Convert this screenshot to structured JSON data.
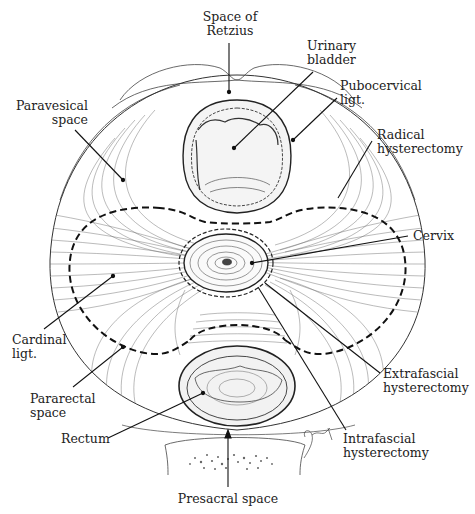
{
  "figure": {
    "colors": {
      "ink": "#222222",
      "fiber": "#555555",
      "background": "#ffffff"
    }
  },
  "labels": [
    {
      "id": "space-of-retzius",
      "text": "Space of\nRetzius",
      "x": 204,
      "y": 12,
      "align": "center",
      "w": 60,
      "leader": [
        [
          229,
          43
        ],
        [
          229,
          92
        ]
      ],
      "dot": [
        229,
        92
      ]
    },
    {
      "id": "urinary-bladder",
      "text": "Urinary\nbladder",
      "x": 308,
      "y": 40,
      "align": "left",
      "w": 60,
      "leader": [
        [
          313,
          72
        ],
        [
          234,
          148
        ]
      ],
      "dot": [
        234,
        148
      ]
    },
    {
      "id": "pubocervical-ligt",
      "text": "Pubocervical\nligt.",
      "x": 341,
      "y": 80,
      "align": "left",
      "w": 90,
      "leader": [
        [
          337,
          98
        ],
        [
          293,
          140
        ]
      ],
      "dot": [
        293,
        140
      ]
    },
    {
      "id": "paravesical-space",
      "text": "Paravesical\nspace",
      "x": 20,
      "y": 100,
      "align": "right",
      "w": 88,
      "leader": [
        [
          75,
          130
        ],
        [
          123,
          180
        ]
      ],
      "dot": [
        123,
        180
      ]
    },
    {
      "id": "radical-hysterectomy",
      "text": "Radical\nhysterectomy",
      "x": 377,
      "y": 128,
      "align": "left",
      "w": 95,
      "leader": [
        [
          372,
          141
        ],
        [
          338,
          198
        ]
      ],
      "dot": null
    },
    {
      "id": "cervix",
      "text": "Cervix",
      "x": 415,
      "y": 230,
      "align": "left",
      "w": 50,
      "leader": [
        [
          408,
          236
        ],
        [
          252,
          263
        ]
      ],
      "dot": [
        252,
        263
      ]
    },
    {
      "id": "cardinal-ligt",
      "text": "Cardinal\nligt.",
      "x": 13,
      "y": 332,
      "align": "left",
      "w": 60,
      "leader": [
        [
          44,
          329
        ],
        [
          113,
          276
        ]
      ],
      "dot": [
        113,
        276
      ]
    },
    {
      "id": "pararectal-space",
      "text": "Pararectal\nspace",
      "x": 30,
      "y": 392,
      "align": "left",
      "w": 70,
      "leader": [
        [
          73,
          387
        ],
        [
          123,
          347
        ]
      ],
      "dot": [
        123,
        347
      ]
    },
    {
      "id": "extrafascial-hysterectomy",
      "text": "Extrafascial\nhysterectomy",
      "x": 384,
      "y": 368,
      "align": "left",
      "w": 95,
      "leader": [
        [
          380,
          373
        ],
        [
          265,
          283
        ]
      ],
      "dot": null
    },
    {
      "id": "rectum",
      "text": "Rectum",
      "x": 62,
      "y": 432,
      "align": "left",
      "w": 55,
      "leader": [
        [
          108,
          438
        ],
        [
          203,
          393
        ]
      ],
      "dot": [
        203,
        393
      ]
    },
    {
      "id": "intrafascial-hysterectomy",
      "text": "Intrafascial\nhysterectomy",
      "x": 343,
      "y": 432,
      "align": "left",
      "w": 95,
      "leader": [
        [
          346,
          430
        ],
        [
          258,
          287
        ]
      ],
      "dot": null
    },
    {
      "id": "presacral-space",
      "text": "Presacral space",
      "x": 185,
      "y": 490,
      "align": "center",
      "w": 110,
      "leader": [
        [
          228,
          487
        ],
        [
          228,
          432
        ]
      ],
      "arrow": true
    }
  ]
}
